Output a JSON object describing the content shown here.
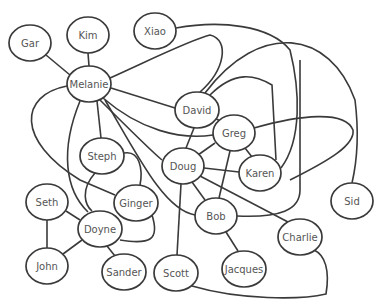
{
  "diagram": {
    "type": "network-graph",
    "nodes": [
      {
        "id": "gar",
        "label": "Gar",
        "x": 30,
        "y": 43,
        "rx": 21,
        "ry": 18
      },
      {
        "id": "kim",
        "label": "Kim",
        "x": 88,
        "y": 35,
        "rx": 21,
        "ry": 18
      },
      {
        "id": "xiao",
        "label": "Xiao",
        "x": 155,
        "y": 31,
        "rx": 21,
        "ry": 18
      },
      {
        "id": "melanie",
        "label": "Melanie",
        "x": 89,
        "y": 84,
        "rx": 22,
        "ry": 18
      },
      {
        "id": "david",
        "label": "David",
        "x": 197,
        "y": 110,
        "rx": 22,
        "ry": 18
      },
      {
        "id": "greg",
        "label": "Greg",
        "x": 234,
        "y": 133,
        "rx": 21,
        "ry": 18
      },
      {
        "id": "steph",
        "label": "Steph",
        "x": 102,
        "y": 156,
        "rx": 22,
        "ry": 18
      },
      {
        "id": "doug",
        "label": "Doug",
        "x": 183,
        "y": 166,
        "rx": 21,
        "ry": 18
      },
      {
        "id": "karen",
        "label": "Karen",
        "x": 260,
        "y": 173,
        "rx": 21,
        "ry": 18
      },
      {
        "id": "sid",
        "label": "Sid",
        "x": 352,
        "y": 201,
        "rx": 21,
        "ry": 18
      },
      {
        "id": "seth",
        "label": "Seth",
        "x": 47,
        "y": 202,
        "rx": 21,
        "ry": 18
      },
      {
        "id": "ginger",
        "label": "Ginger",
        "x": 136,
        "y": 203,
        "rx": 22,
        "ry": 18
      },
      {
        "id": "doyne",
        "label": "Doyne",
        "x": 100,
        "y": 229,
        "rx": 22,
        "ry": 18
      },
      {
        "id": "bob",
        "label": "Bob",
        "x": 216,
        "y": 216,
        "rx": 21,
        "ry": 18
      },
      {
        "id": "charlie",
        "label": "Charlie",
        "x": 300,
        "y": 237,
        "rx": 22,
        "ry": 18
      },
      {
        "id": "john",
        "label": "John",
        "x": 47,
        "y": 266,
        "rx": 21,
        "ry": 18
      },
      {
        "id": "sander",
        "label": "Sander",
        "x": 124,
        "y": 272,
        "rx": 22,
        "ry": 18
      },
      {
        "id": "scott",
        "label": "Scott",
        "x": 176,
        "y": 273,
        "rx": 22,
        "ry": 18
      },
      {
        "id": "jacques",
        "label": "Jacques",
        "x": 244,
        "y": 269,
        "rx": 22,
        "ry": 18
      }
    ],
    "edges": [
      {
        "from": "gar",
        "to": "melanie",
        "d": "M46,55 L70,75"
      },
      {
        "from": "kim",
        "to": "melanie",
        "d": "M88,53 L89,66"
      },
      {
        "from": "melanie",
        "to": "xiao-david-arc",
        "d": "M110,78 C150,60 190,40 210,35 C230,40 225,70 200,92"
      },
      {
        "from": "melanie",
        "to": "david",
        "d": "M111,88 L175,108"
      },
      {
        "from": "melanie",
        "to": "steph",
        "d": "M97,101 L101,138"
      },
      {
        "from": "melanie",
        "to": "doyne",
        "d": "M80,101 C60,150 65,190 88,212"
      },
      {
        "from": "melanie",
        "to": "ginger",
        "d": "M67,86 C20,95 15,140 80,180 L115,195"
      },
      {
        "from": "melanie",
        "to": "greg",
        "d": "M103,98 C140,130 180,140 213,135"
      },
      {
        "from": "melanie",
        "to": "doug",
        "d": "M100,100 C130,130 150,150 162,160"
      },
      {
        "from": "melanie",
        "to": "bob",
        "d": "M105,100 C140,160 165,210 195,215"
      },
      {
        "from": "xiao",
        "to": "karen",
        "d": "M176,28 C220,20 270,25 290,50 C300,90 302,140 281,168"
      },
      {
        "from": "david",
        "to": "sid",
        "d": "M205,93 C260,20 330,30 355,100 C360,140 355,170 352,183"
      },
      {
        "from": "david",
        "to": "karen",
        "d": "M210,95 C235,70 255,75 272,85 L276,160"
      },
      {
        "from": "david",
        "to": "greg",
        "d": "M215,118 L223,123"
      },
      {
        "from": "david",
        "to": "doug",
        "d": "M194,128 L186,148"
      },
      {
        "from": "greg",
        "to": "karen",
        "d": "M245,148 L252,157"
      },
      {
        "from": "greg",
        "to": "bob",
        "d": "M230,151 L219,198"
      },
      {
        "from": "greg",
        "to": "doug",
        "d": "M215,143 L198,155"
      },
      {
        "from": "greg",
        "to": "east-loop",
        "d": "M254,128 C300,115 345,110 353,130 C355,145 330,160 290,180"
      },
      {
        "from": "doug",
        "to": "karen",
        "d": "M204,168 L239,172"
      },
      {
        "from": "doug",
        "to": "bob",
        "d": "M192,182 L205,200"
      },
      {
        "from": "doug",
        "to": "charlie",
        "d": "M200,176 L288,222"
      },
      {
        "from": "doug",
        "to": "scott",
        "d": "M181,184 L177,255"
      },
      {
        "from": "bob",
        "to": "east-curve",
        "d": "M237,216 C280,218 300,210 300,190 L300,60"
      },
      {
        "from": "bob",
        "to": "jacques",
        "d": "M226,232 L238,251"
      },
      {
        "from": "steph",
        "to": "ginger",
        "d": "M124,153 C140,150 143,170 140,185"
      },
      {
        "from": "steph",
        "to": "doyne",
        "d": "M95,173 C80,190 85,205 92,211"
      },
      {
        "from": "ginger",
        "to": "doyne",
        "d": "M152,215 C160,240 150,245 120,240"
      },
      {
        "from": "seth",
        "to": "doyne",
        "d": "M66,211 L80,220"
      },
      {
        "from": "seth",
        "to": "john",
        "d": "M47,220 L47,248"
      },
      {
        "from": "john",
        "to": "doyne",
        "d": "M63,254 L82,240"
      },
      {
        "from": "doyne",
        "to": "sander",
        "d": "M107,246 L115,256"
      },
      {
        "from": "scott",
        "to": "charlie",
        "d": "M192,286 C240,300 300,300 326,294 C330,270 325,255 314,250"
      }
    ]
  }
}
